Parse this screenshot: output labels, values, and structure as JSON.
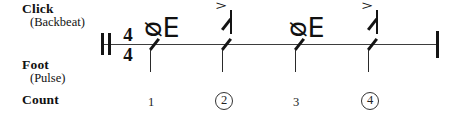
{
  "diagram": {
    "time_signature": {
      "numerator": "4",
      "denominator": "4"
    },
    "staff": {
      "opening_barline": "thick-double-barline",
      "closing_barline": "single-barline"
    },
    "rows": [
      {
        "id": "click",
        "label": "Click",
        "sublabel": "(Backbeat)"
      },
      {
        "id": "foot",
        "label": "Foot",
        "sublabel": "(Pulse)"
      },
      {
        "id": "count",
        "label": "Count",
        "sublabel": ""
      }
    ],
    "beats": [
      {
        "count": "1",
        "count_circled": false,
        "click": {
          "symbol": "quarter-rest",
          "glyph": "ᴓE",
          "accent": false
        },
        "foot": {
          "symbol": "slash-notehead",
          "accent": false
        }
      },
      {
        "count": "2",
        "count_circled": true,
        "click": {
          "symbol": "slash-note-stem-up",
          "accent": true,
          "accent_glyph": ">"
        },
        "foot": {
          "symbol": "slash-notehead",
          "accent": false
        }
      },
      {
        "count": "3",
        "count_circled": false,
        "click": {
          "symbol": "quarter-rest",
          "glyph": "ᴓE",
          "accent": false
        },
        "foot": {
          "symbol": "slash-notehead",
          "accent": false
        }
      },
      {
        "count": "4",
        "count_circled": true,
        "click": {
          "symbol": "slash-note-stem-up",
          "accent": true,
          "accent_glyph": ">"
        },
        "foot": {
          "symbol": "slash-notehead",
          "accent": false
        }
      }
    ],
    "colors": {
      "ink": "#141414",
      "staff_line": "#3d3d3d",
      "background": "#ffffff"
    }
  }
}
